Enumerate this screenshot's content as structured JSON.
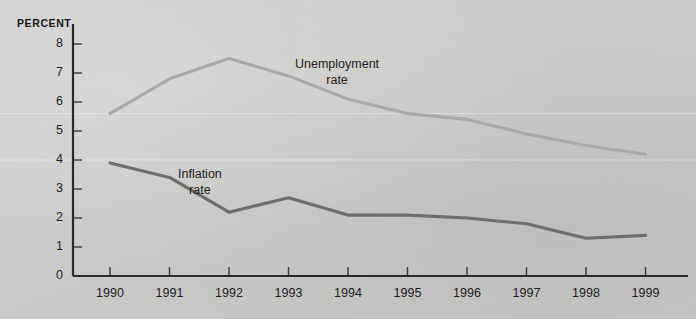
{
  "chart_data": {
    "type": "line",
    "title": "",
    "xlabel": "",
    "ylabel": "PERCENT",
    "x": [
      1990,
      1991,
      1992,
      1993,
      1994,
      1995,
      1996,
      1997,
      1998,
      1999
    ],
    "xtick_labels": [
      "1990",
      "1991",
      "1992",
      "1993",
      "1994",
      "1995",
      "1996",
      "1997",
      "1998",
      "1999"
    ],
    "ytick_labels": [
      "0",
      "1",
      "2",
      "3",
      "4",
      "5",
      "6",
      "7",
      "8"
    ],
    "yticks": [
      0,
      1,
      2,
      3,
      4,
      5,
      6,
      7,
      8
    ],
    "ylim": [
      0,
      8.4
    ],
    "xlim": [
      1989.55,
      1999.5
    ],
    "grid": false,
    "legend": "annotations-inline",
    "series": [
      {
        "name": "Unemployment rate",
        "color": "#a9a9a7",
        "values": [
          5.6,
          6.8,
          7.5,
          6.9,
          6.1,
          5.6,
          5.4,
          4.9,
          4.5,
          4.2
        ]
      },
      {
        "name": "Inflation rate",
        "color": "#6d6d6b",
        "values": [
          3.9,
          3.4,
          2.2,
          2.7,
          2.1,
          2.1,
          2.0,
          1.8,
          1.3,
          1.4
        ]
      }
    ],
    "annotations": [
      {
        "text_line1": "Unemployment",
        "text_line2": "rate",
        "series": "Unemployment rate"
      },
      {
        "text_line1": "Inflation",
        "text_line2": "rate",
        "series": "Inflation rate"
      }
    ]
  },
  "axis": {
    "y_axis_caption": "PERCENT"
  },
  "colors": {
    "background": "#cbcbc9",
    "axis": "#2a2a2a",
    "unemployment_line": "#a9a9a7",
    "inflation_line": "#6d6d6b",
    "text": "#1d1d1d"
  }
}
